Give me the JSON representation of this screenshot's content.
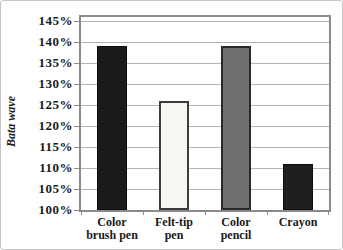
{
  "figure": {
    "background": "#ffffff",
    "border_color": "#c6c6c6",
    "frame_color": "#8a8a8a",
    "gridline_color": "#b4b4b4",
    "text_color": "#1a1a1a"
  },
  "chart_data": {
    "type": "bar",
    "title": "",
    "xlabel": "",
    "ylabel": "Bata wave",
    "unit": "%",
    "categories": [
      "Color brush pen",
      "Felt-tip pen",
      "Color pencil",
      "Crayon"
    ],
    "category_lines": [
      [
        "Color",
        "brush pen"
      ],
      [
        "Felt-tip",
        "pen"
      ],
      [
        "Color",
        "pencil"
      ],
      [
        "Crayon"
      ]
    ],
    "values": [
      139,
      126,
      139,
      111
    ],
    "ylim": [
      100,
      146
    ],
    "yticks": [
      100,
      105,
      110,
      115,
      120,
      125,
      130,
      135,
      140,
      145
    ],
    "ytick_labels": [
      "100%",
      "105%",
      "110%",
      "115%",
      "120%",
      "125%",
      "130%",
      "135%",
      "140%",
      "145%"
    ],
    "grid": true,
    "legend": false,
    "bar_styles": [
      {
        "fill": "#1b1b1b",
        "border": "#0d0d0d",
        "border_width": 1
      },
      {
        "fill": "#f7f6f1",
        "border": "#3c3c3c",
        "border_width": 2
      },
      {
        "fill": "#6f6f6f",
        "border": "#2a2a2a",
        "border_width": 2
      },
      {
        "fill": "#1f1f1f",
        "border": "#0d0d0d",
        "border_width": 1
      }
    ]
  }
}
